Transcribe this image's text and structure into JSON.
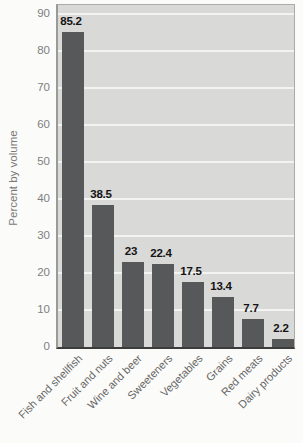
{
  "chart_data": {
    "type": "bar",
    "categories": [
      "Fish and shellfish",
      "Fruit and nuts",
      "Wine and beer",
      "Sweeteners",
      "Vegetables",
      "Grains",
      "Red meats",
      "Dairy products"
    ],
    "values": [
      85.2,
      38.5,
      23,
      22.4,
      17.5,
      13.4,
      7.7,
      2.2
    ],
    "value_labels": [
      "85.2",
      "38.5",
      "23",
      "22.4",
      "17.5",
      "13.4",
      "7.7",
      "2.2"
    ],
    "title": "",
    "xlabel": "",
    "ylabel": "Percent by volume",
    "ylim": [
      0,
      90
    ],
    "yticks": [
      0,
      10,
      20,
      30,
      40,
      50,
      60,
      70,
      80,
      90
    ],
    "grid": "horizontal",
    "legend": "none",
    "colors": {
      "bar": "#57585a",
      "plot_background": "#d9d9d7",
      "gridline": "#f3f3f1",
      "axis_line": "#3c3c3c",
      "plot_border": "#ababa9",
      "tick_text": "#7f7f7f",
      "category_text": "#666666",
      "value_text": "#141414",
      "ylabel_text": "#7a7a7a",
      "page_background": "#fbfbf9"
    }
  }
}
